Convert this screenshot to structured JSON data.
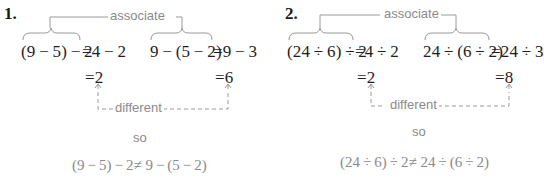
{
  "problems": [
    {
      "number": "1.",
      "associate_label": "associate",
      "left_expr": "(9 − 5) − 2",
      "left_rhs": "=4 − 2",
      "right_expr": "9 − (5 − 2)",
      "right_rhs": "=9 − 3",
      "left_result": "=2",
      "right_result": "=6",
      "different_label": "different",
      "so_label": "so",
      "conclusion": "(9 − 5) − 2≠ 9 − (5 − 2)"
    },
    {
      "number": "2.",
      "associate_label": "associate",
      "left_expr": "(24 ÷ 6) ÷ 2",
      "left_rhs": "=4 ÷ 2",
      "right_expr": "24 ÷ (6 ÷ 2)",
      "right_rhs": "=24 ÷ 3",
      "left_result": "=2",
      "right_result": "=8",
      "different_label": "different",
      "so_label": "so",
      "conclusion": "(24 ÷ 6) ÷ 2≠ 24 ÷ (6 ÷ 2)"
    }
  ],
  "colors": {
    "text": "#1e1e1e",
    "annotation": "#8a8a8a",
    "bracket": "#9a9a9a"
  }
}
